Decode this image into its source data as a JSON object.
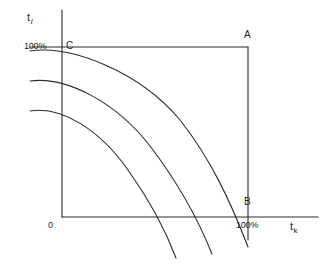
{
  "figure": {
    "background_color": "#ffffff",
    "line_color": "#2b2b2b",
    "title": ""
  },
  "axes": {
    "y_axis": {
      "label_base": "t",
      "label_subscript": "l",
      "name": "t_l",
      "x": 62,
      "y_top": 10,
      "y_bottom": 217
    },
    "x_axis": {
      "label_base": "t",
      "label_subscript": "k",
      "name": "t_k",
      "y": 217,
      "x_left": 62,
      "x_right": 318
    },
    "origin_label": "0"
  },
  "ticks": {
    "y_100_percent": "100%",
    "x_100_percent": "100%"
  },
  "points": [
    {
      "id": "A",
      "label": "A",
      "x": 248,
      "y": 47
    },
    {
      "id": "B",
      "label": "B",
      "x": 248,
      "y": 217
    },
    {
      "id": "C",
      "label": "C",
      "x": 62,
      "y": 47
    }
  ],
  "construction_lines": {
    "horizontal_from_C_to_A": {
      "x1": 30,
      "y1": 47,
      "x2": 248,
      "y2": 47
    },
    "vertical_from_A_through_B": {
      "x1": 248,
      "y1": 47,
      "x2": 248,
      "y2": 240
    }
  },
  "chart_data": {
    "type": "line",
    "title": "",
    "xlabel": "t_k",
    "ylabel": "t_l",
    "grid": false,
    "legend": null,
    "annotations": [
      "A",
      "B",
      "C",
      "0",
      "100%",
      "100%"
    ],
    "series": [
      {
        "name": "curve-1-upper",
        "start_flat_y": 50,
        "x_axis_crossing": 232,
        "path": "M 30 51 C 72 45, 140 72, 180 120 C 210 158, 230 200, 248 247"
      },
      {
        "name": "curve-2-middle",
        "start_flat_y": 80,
        "x_axis_crossing": 200,
        "path": "M 30 81 C 66 76, 116 102, 150 146 C 176 180, 196 214, 212 254"
      },
      {
        "name": "curve-3-lower",
        "start_flat_y": 110,
        "x_axis_crossing": 168,
        "path": "M 30 111 C 62 106, 100 130, 128 170 C 148 198, 164 226, 176 258"
      }
    ]
  }
}
